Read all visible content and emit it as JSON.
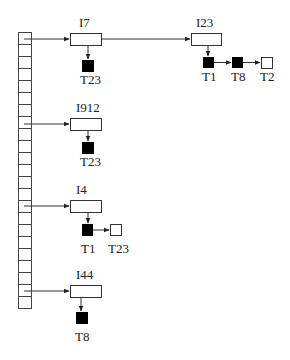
{
  "diagram": {
    "type": "hash-table-chains",
    "hash_table": {
      "cell_count": 23
    },
    "colors": {
      "stroke": "#333333",
      "held": "#000000",
      "waiting": "#ffffff",
      "text": "#222222"
    },
    "chains": [
      {
        "slot": 0,
        "items": [
          {
            "label": "I7",
            "locks": [
              {
                "label": "T23",
                "state": "held"
              }
            ]
          },
          {
            "label": "I23",
            "locks": [
              {
                "label": "T1",
                "state": "held"
              },
              {
                "label": "T8",
                "state": "held"
              },
              {
                "label": "T2",
                "state": "waiting"
              }
            ]
          }
        ]
      },
      {
        "slot": 7,
        "items": [
          {
            "label": "I912",
            "locks": [
              {
                "label": "T23",
                "state": "held"
              }
            ]
          }
        ]
      },
      {
        "slot": 14,
        "items": [
          {
            "label": "I4",
            "locks": [
              {
                "label": "T1",
                "state": "held"
              },
              {
                "label": "T23",
                "state": "waiting"
              }
            ]
          }
        ]
      },
      {
        "slot": 21,
        "items": [
          {
            "label": "I44",
            "locks": [
              {
                "label": "T8",
                "state": "held"
              }
            ]
          }
        ]
      }
    ]
  },
  "labels": {
    "i7": "I7",
    "i7_t23": "T23",
    "i23": "I23",
    "i23_t1": "T1",
    "i23_t8": "T8",
    "i23_t2": "T2",
    "i912": "I912",
    "i912_t23": "T23",
    "i4": "I4",
    "i4_t1": "T1",
    "i4_t23": "T23",
    "i44": "I44",
    "i44_t8": "T8"
  }
}
